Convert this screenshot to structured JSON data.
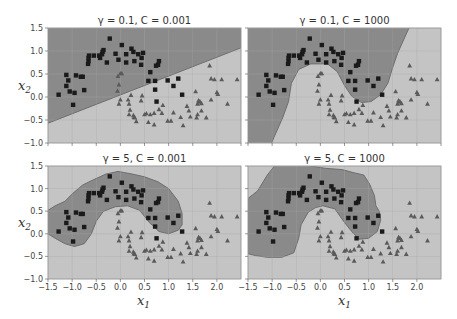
{
  "figure": {
    "width": 457,
    "height": 319,
    "xlabel": "x1",
    "ylabel": "x2"
  },
  "colors": {
    "class0_region": "#8a8a8a",
    "class1_region": "#c4c4c4",
    "boundary": "#6e6e6e",
    "square_marker": "#1a1a1a",
    "triangle_marker": "#5a5a5a",
    "grid": "#a8a8a8",
    "frame": "#999999"
  },
  "chart_data": [
    {
      "type": "scatter",
      "title": "γ = 0.1, C = 0.001",
      "gamma": 0.1,
      "C": 0.001,
      "position": "top-left",
      "xlim": [
        -1.5,
        2.5
      ],
      "ylim": [
        -1.0,
        1.5
      ],
      "xticks": [],
      "yticks": [
        "-1.0",
        "-0.5",
        "0.0",
        "0.5",
        "1.0",
        "1.5"
      ],
      "ylabel": "x2",
      "xlabel": "",
      "grid": true,
      "boundary_type": "linear"
    },
    {
      "type": "scatter",
      "title": "γ = 0.1, C = 1000",
      "gamma": 0.1,
      "C": 1000,
      "position": "top-right",
      "xlim": [
        -1.5,
        2.5
      ],
      "ylim": [
        -1.0,
        1.5
      ],
      "xticks": [],
      "yticks": [],
      "grid": true,
      "boundary_type": "smooth-curve"
    },
    {
      "type": "scatter",
      "title": "γ = 5, C = 0.001",
      "gamma": 5,
      "C": 0.001,
      "position": "bottom-left",
      "xlim": [
        -1.5,
        2.5
      ],
      "ylim": [
        -1.0,
        1.5
      ],
      "xticks": [
        "-1.5",
        "-1.0",
        "-0.5",
        "0.0",
        "0.5",
        "1.0",
        "1.5",
        "2.0"
      ],
      "yticks": [
        "-1.0",
        "-0.5",
        "0.0",
        "0.5",
        "1.0",
        "1.5"
      ],
      "xlabel": "x1",
      "ylabel": "x2",
      "grid": true,
      "boundary_type": "island-around-squares"
    },
    {
      "type": "scatter",
      "title": "γ = 5, C = 1000",
      "gamma": 5,
      "C": 1000,
      "position": "bottom-right",
      "xlim": [
        -1.5,
        2.5
      ],
      "ylim": [
        -1.0,
        1.5
      ],
      "xticks": [
        "-1.5",
        "-1.0",
        "-0.5",
        "0.0",
        "0.5",
        "1.0",
        "1.5",
        "2.0"
      ],
      "yticks": [],
      "xlabel": "x1",
      "grid": true,
      "boundary_type": "irregular-island"
    }
  ],
  "points": {
    "squares": [
      [
        -1.28,
        0.05
      ],
      [
        -1.12,
        0.48
      ],
      [
        -1.08,
        0.36
      ],
      [
        -1.12,
        0.24
      ],
      [
        -1.05,
        0.12
      ],
      [
        -0.98,
        -0.17
      ],
      [
        -0.95,
        0.09
      ],
      [
        -0.92,
        0.47
      ],
      [
        -0.82,
        0.44
      ],
      [
        -0.78,
        0.44
      ],
      [
        -0.75,
        0.15
      ],
      [
        -0.67,
        0.72
      ],
      [
        -0.66,
        0.78
      ],
      [
        -0.66,
        0.85
      ],
      [
        -0.65,
        0.9
      ],
      [
        -0.55,
        0.9
      ],
      [
        -0.44,
        0.9
      ],
      [
        -0.42,
        0.85
      ],
      [
        -0.38,
        0.93
      ],
      [
        -0.37,
        0.98
      ],
      [
        -0.35,
        1.02
      ],
      [
        -0.28,
        0.75
      ],
      [
        -0.22,
        1.27
      ],
      [
        -0.1,
        0.94
      ],
      [
        -0.04,
        0.81
      ],
      [
        0.03,
        1.13
      ],
      [
        0.12,
        0.75
      ],
      [
        0.12,
        0.93
      ],
      [
        0.23,
        1.05
      ],
      [
        0.27,
        0.98
      ],
      [
        0.29,
        0.78
      ],
      [
        0.37,
        0.93
      ],
      [
        0.43,
        0.7
      ],
      [
        0.44,
        0.85
      ],
      [
        0.47,
        0.96
      ],
      [
        0.58,
        0.35
      ],
      [
        0.62,
        0.54
      ],
      [
        0.72,
        0.35
      ],
      [
        0.74,
        0.68
      ],
      [
        0.78,
        0.7
      ],
      [
        0.8,
        0.78
      ],
      [
        0.72,
        0.16
      ],
      [
        0.75,
        -0.1
      ],
      [
        0.98,
        0.36
      ],
      [
        1.1,
        0.24
      ],
      [
        1.2,
        0.4
      ],
      [
        1.28,
        0.05
      ]
    ],
    "triangles": [
      [
        -0.05,
        0.45
      ],
      [
        -0.03,
        0.27
      ],
      [
        0.0,
        0.51
      ],
      [
        0.03,
        0.51
      ],
      [
        -0.06,
        0.13
      ],
      [
        0.0,
        -0.06
      ],
      [
        -0.03,
        -0.15
      ],
      [
        0.16,
        -0.06
      ],
      [
        0.18,
        -0.15
      ],
      [
        0.2,
        -0.28
      ],
      [
        0.18,
        -0.38
      ],
      [
        0.27,
        -0.4
      ],
      [
        0.28,
        -0.44
      ],
      [
        0.22,
        0.04
      ],
      [
        0.3,
        -0.45
      ],
      [
        0.33,
        -0.53
      ],
      [
        0.43,
        -0.08
      ],
      [
        0.45,
        0.03
      ],
      [
        0.5,
        -0.38
      ],
      [
        0.54,
        -0.36
      ],
      [
        0.58,
        -0.55
      ],
      [
        0.62,
        -0.38
      ],
      [
        0.7,
        -0.6
      ],
      [
        0.7,
        -0.35
      ],
      [
        0.8,
        -0.27
      ],
      [
        0.86,
        -0.35
      ],
      [
        0.88,
        -0.18
      ],
      [
        0.98,
        -0.52
      ],
      [
        1.05,
        -0.52
      ],
      [
        1.1,
        -0.34
      ],
      [
        1.25,
        -0.44
      ],
      [
        1.3,
        -0.62
      ],
      [
        1.38,
        -0.2
      ],
      [
        1.42,
        -0.3
      ],
      [
        1.45,
        -0.43
      ],
      [
        1.56,
        0.12
      ],
      [
        1.58,
        -0.45
      ],
      [
        1.6,
        -0.38
      ],
      [
        1.62,
        -0.08
      ],
      [
        1.65,
        -0.1
      ],
      [
        1.68,
        -0.14
      ],
      [
        1.78,
        -0.45
      ],
      [
        1.85,
        0.68
      ],
      [
        1.88,
        -0.06
      ],
      [
        1.88,
        0.4
      ],
      [
        1.95,
        0.38
      ],
      [
        2.0,
        0.1
      ],
      [
        2.02,
        0.06
      ],
      [
        2.1,
        0.38
      ],
      [
        2.22,
        -0.15
      ],
      [
        2.42,
        0.38
      ],
      [
        1.68,
        -0.3
      ],
      [
        1.6,
        -0.15
      ],
      [
        1.63,
        -0.1
      ]
    ]
  }
}
